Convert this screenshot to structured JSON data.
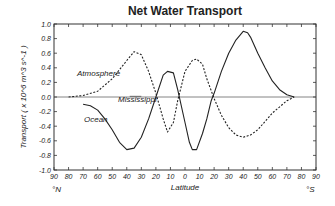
{
  "chart_data": {
    "type": "line",
    "title": "Net Water Transport",
    "xlabel": "Latitude",
    "ylabel": "Transport ( x 10^6 m^3 s^-1 )",
    "x_left_label": "°N",
    "x_right_label": "°S",
    "xlim": [
      -90,
      90
    ],
    "ylim": [
      -1.0,
      1.0
    ],
    "x_tick_labels": [
      "90",
      "80",
      "70",
      "60",
      "50",
      "40",
      "30",
      "20",
      "10",
      "0",
      "10",
      "20",
      "30",
      "40",
      "50",
      "60",
      "70",
      "80",
      "90"
    ],
    "y_tick_labels": [
      "1.0",
      "0.8",
      "0.6",
      "0.4",
      "0.2",
      "0.0",
      "-0.2",
      "-0.4",
      "-0.6",
      "-0.8",
      "-1.0"
    ],
    "grid": false,
    "note": "x values: negative = North latitude, positive = South latitude",
    "series": [
      {
        "name": "Atmosphere",
        "style": "dashed",
        "x": [
          -80,
          -70,
          -60,
          -50,
          -40,
          -35,
          -30,
          -25,
          -20,
          -15,
          -12,
          -8,
          -5,
          0,
          5,
          8,
          12,
          15,
          20,
          25,
          30,
          35,
          40,
          45,
          50,
          60,
          70,
          75
        ],
        "y": [
          0.0,
          0.02,
          0.08,
          0.25,
          0.5,
          0.62,
          0.58,
          0.35,
          0.05,
          -0.3,
          -0.48,
          -0.35,
          -0.05,
          0.35,
          0.5,
          0.52,
          0.45,
          0.25,
          -0.02,
          -0.25,
          -0.42,
          -0.52,
          -0.55,
          -0.52,
          -0.45,
          -0.22,
          -0.05,
          0.0
        ]
      },
      {
        "name": "Ocean",
        "style": "solid",
        "x": [
          -70,
          -65,
          -60,
          -55,
          -50,
          -45,
          -40,
          -35,
          -30,
          -25,
          -20,
          -15,
          -12,
          -8,
          -5,
          0,
          3,
          5,
          8,
          12,
          15,
          18,
          20,
          25,
          30,
          35,
          40,
          43,
          45,
          50,
          55,
          60,
          65,
          70,
          75
        ],
        "y": [
          -0.1,
          -0.12,
          -0.18,
          -0.3,
          -0.45,
          -0.62,
          -0.72,
          -0.7,
          -0.55,
          -0.3,
          0.0,
          0.3,
          0.35,
          0.33,
          0.1,
          -0.35,
          -0.62,
          -0.72,
          -0.72,
          -0.5,
          -0.3,
          -0.05,
          0.05,
          0.35,
          0.6,
          0.78,
          0.9,
          0.88,
          0.82,
          0.6,
          0.4,
          0.22,
          0.1,
          0.03,
          0.0
        ]
      },
      {
        "name": "Mississippi",
        "style": "thin",
        "x": [
          -38,
          -30
        ],
        "y": [
          0.01,
          0.01
        ]
      }
    ],
    "annotations": [
      "Atmosphere",
      "Mississippi",
      "Ocean"
    ]
  }
}
